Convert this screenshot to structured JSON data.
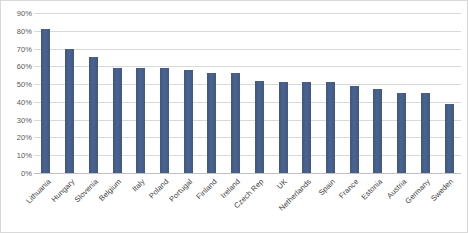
{
  "chart_data": {
    "type": "bar",
    "title": "",
    "subtitle": "",
    "xlabel": "",
    "ylabel": "",
    "ylim": [
      0,
      90
    ],
    "ytick_labels": [
      "90%",
      "80%",
      "70%",
      "60%",
      "50%",
      "40%",
      "30%",
      "20%",
      "10%",
      "0%"
    ],
    "ytick_values": [
      90,
      80,
      70,
      60,
      50,
      40,
      30,
      20,
      10,
      0
    ],
    "grid": true,
    "legend": false,
    "legend_position": "none",
    "value_suffix": "%",
    "bar_color": "#46608c",
    "gridline_color": "#d9d9d9",
    "border_color": "#d9d9d9",
    "categories": [
      "Lithuania",
      "Hungary",
      "Slovenia",
      "Belgium",
      "Italy",
      "Poland",
      "Portugal",
      "Finland",
      "Ireland",
      "Czech Rep",
      "UK",
      "Netherlands",
      "Spain",
      "France",
      "Estonia",
      "Austria",
      "Germany",
      "Sweden"
    ],
    "values": [
      81,
      70,
      65,
      59,
      59,
      59,
      58,
      56,
      56,
      52,
      51,
      51,
      51,
      49,
      47,
      45,
      45,
      39
    ]
  }
}
